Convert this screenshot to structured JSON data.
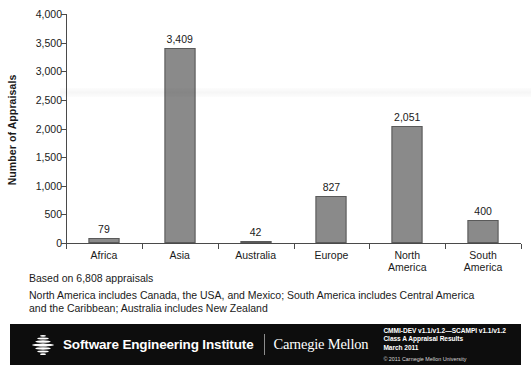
{
  "chart_data": {
    "type": "bar",
    "title": "",
    "xlabel": "",
    "ylabel": "Number of Appraisals",
    "categories": [
      "Africa",
      "Asia",
      "Australia",
      "Europe",
      "North America",
      "South America"
    ],
    "values": [
      79,
      3409,
      42,
      827,
      2051,
      400
    ],
    "value_labels": [
      "79",
      "3,409",
      "42",
      "827",
      "2,051",
      "400"
    ],
    "ylim": [
      0,
      4000
    ],
    "yticks": [
      0,
      500,
      1000,
      1500,
      2000,
      2500,
      3000,
      3500,
      4000
    ],
    "ytick_labels": [
      "0",
      "500",
      "1,000",
      "1,500",
      "2,000",
      "2,500",
      "3,000",
      "3,500",
      "4,000"
    ],
    "grid": false,
    "legend": "none",
    "bar_color": "#8a8a8a",
    "bar_edge_color": "#5a5a5a",
    "axis_color": "#4a4a4a"
  },
  "category_lines": [
    [
      "Africa"
    ],
    [
      "Asia"
    ],
    [
      "Australia"
    ],
    [
      "Europe"
    ],
    [
      "North",
      "America"
    ],
    [
      "South",
      "America"
    ]
  ],
  "notes": {
    "basis": "Based on 6,808 appraisals",
    "regions": "North America includes Canada, the USA, and Mexico; South America includes Central America and the Caribbean; Australia includes New Zealand"
  },
  "footer": {
    "sei_name": "Software Engineering Institute",
    "cmu_name": "Carnegie Mellon",
    "meta_line1": "CMMI-DEV v1.1/v1.2—SCAMPI v1.1/v1.2",
    "meta_line2": "Class A Appraisal Results",
    "meta_line3": "March 2011",
    "copyright": "© 2011 Carnegie Mellon University",
    "background": "#0d0d0d"
  }
}
